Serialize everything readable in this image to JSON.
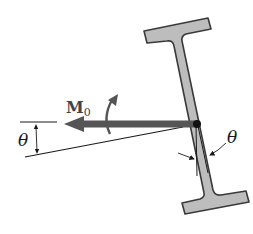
{
  "diagram": {
    "labels": {
      "moment_symbol": "M",
      "moment_subscript": "0",
      "angle_left": "θ",
      "angle_right": "θ"
    },
    "colors": {
      "beam_fill": "#bdbdbd",
      "beam_stroke": "#3a3a3a",
      "arrow": "#555555",
      "line": "#1a1a1a",
      "pivot": "#111111"
    },
    "elements": [
      {
        "id": "i-beam",
        "description": "I-beam cross-section tilted from vertical by angle θ"
      },
      {
        "id": "moment-vector",
        "description": "Horizontal double-weight arrow M0 pointing left from pivot"
      },
      {
        "id": "rotation-arrow",
        "description": "Curved arrow indicating rotation sense of M0"
      },
      {
        "id": "angle-left",
        "description": "Angle θ between horizontal reference and inclined line"
      },
      {
        "id": "angle-right",
        "description": "Angle θ between vertical and beam web axis"
      }
    ]
  }
}
